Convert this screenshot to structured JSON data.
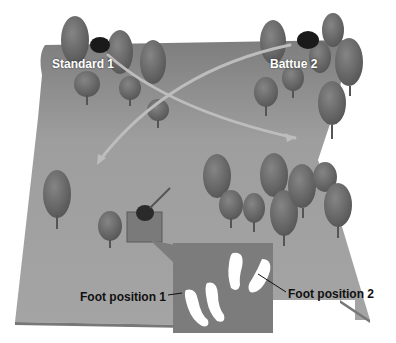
{
  "diagram": {
    "labels": {
      "stand_1": "Standard 1",
      "stand_2": "Battue 2",
      "foot_1": "Foot position 1",
      "foot_2": "Foot position 2"
    },
    "colors": {
      "field": "#9a9a9a",
      "field_edge": "#7a7a7a",
      "tree": "#6e6e6e",
      "trap_house": "#1a1a1a",
      "inset": "#7c7c7c",
      "footprint": "#ffffff",
      "flight_path": "#b8b8b8"
    }
  }
}
